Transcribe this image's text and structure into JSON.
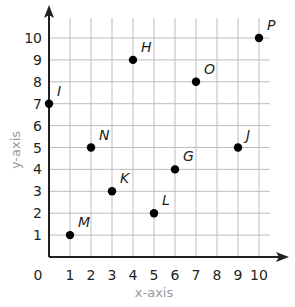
{
  "chart_data": {
    "type": "scatter",
    "title": "",
    "xlabel": "x-axis",
    "ylabel": "y-axis",
    "xlim": [
      0,
      10
    ],
    "ylim": [
      0,
      10
    ],
    "grid": true,
    "x_ticks": [
      "0",
      "1",
      "2",
      "3",
      "4",
      "5",
      "6",
      "7",
      "8",
      "9",
      "10"
    ],
    "y_ticks": [
      "1",
      "2",
      "3",
      "4",
      "5",
      "6",
      "7",
      "8",
      "9",
      "10"
    ],
    "points": [
      {
        "label": "I",
        "x": 0,
        "y": 7
      },
      {
        "label": "M",
        "x": 1,
        "y": 1
      },
      {
        "label": "N",
        "x": 2,
        "y": 5
      },
      {
        "label": "K",
        "x": 3,
        "y": 3
      },
      {
        "label": "H",
        "x": 4,
        "y": 9
      },
      {
        "label": "L",
        "x": 5,
        "y": 2
      },
      {
        "label": "G",
        "x": 6,
        "y": 4
      },
      {
        "label": "O",
        "x": 7,
        "y": 8
      },
      {
        "label": "J",
        "x": 9,
        "y": 5
      },
      {
        "label": "P",
        "x": 10,
        "y": 10
      }
    ]
  },
  "colors": {
    "axis": "#231f20",
    "grid": "#bdbdbd",
    "point": "#000000",
    "axis_label": "#9a9a9a"
  }
}
